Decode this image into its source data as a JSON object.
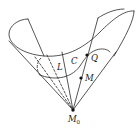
{
  "diagram": {
    "labels": {
      "L": "L",
      "C": "C",
      "Q": "Q",
      "M": "M",
      "M0_main": "M",
      "M0_sub": "0"
    },
    "points": [
      {
        "name": "Q",
        "x": 87,
        "y": 55
      },
      {
        "name": "M",
        "x": 81,
        "y": 78
      },
      {
        "name": "M0",
        "x": 73,
        "y": 110
      }
    ],
    "colors": {
      "line": "#2a2a2a",
      "point": "#111111",
      "background": "#ffffff"
    }
  }
}
